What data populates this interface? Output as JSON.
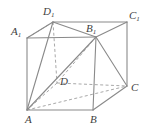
{
  "figure": {
    "kind": "3d-solid-diagram",
    "solid_name": "parallelepiped ABCD-A1B1C1D1",
    "stroke_color": "#8a8a8a",
    "hidden_stroke_color": "#a8a8a8",
    "label_color": "#3f3f3f",
    "background_color": "#ffffff",
    "vertices": [
      {
        "id": "D1",
        "base": "D",
        "sub": "1",
        "x": 53,
        "y": 22,
        "label_x": 43,
        "label_y": 6
      },
      {
        "id": "C1",
        "base": "C",
        "sub": "1",
        "x": 127,
        "y": 22,
        "label_x": 129,
        "label_y": 10
      },
      {
        "id": "A1",
        "base": "A",
        "sub": "1",
        "x": 27,
        "y": 38,
        "label_x": 11,
        "label_y": 26
      },
      {
        "id": "B1",
        "base": "B",
        "sub": "1",
        "x": 96,
        "y": 37,
        "label_x": 86,
        "label_y": 23
      },
      {
        "id": "D",
        "base": "D",
        "sub": "",
        "x": 57,
        "y": 83,
        "label_x": 60,
        "label_y": 76
      },
      {
        "id": "C",
        "base": "C",
        "sub": "",
        "x": 127,
        "y": 86,
        "label_x": 131,
        "label_y": 82
      },
      {
        "id": "A",
        "base": "A",
        "sub": "",
        "x": 27,
        "y": 110,
        "label_x": 25,
        "label_y": 114
      },
      {
        "id": "B",
        "base": "B",
        "sub": "",
        "x": 93,
        "y": 110,
        "label_x": 90,
        "label_y": 114
      }
    ],
    "edges_solid": [
      {
        "from": "A1",
        "to": "D1"
      },
      {
        "from": "D1",
        "to": "C1"
      },
      {
        "from": "A1",
        "to": "B1"
      },
      {
        "from": "B1",
        "to": "C1"
      },
      {
        "from": "A1",
        "to": "A"
      },
      {
        "from": "B1",
        "to": "B"
      },
      {
        "from": "C1",
        "to": "C"
      },
      {
        "from": "A",
        "to": "B"
      },
      {
        "from": "B",
        "to": "C"
      },
      {
        "from": "D1",
        "to": "A"
      },
      {
        "from": "D1",
        "to": "B1"
      },
      {
        "from": "B1",
        "to": "A"
      },
      {
        "from": "B1",
        "to": "C"
      }
    ],
    "edges_dashed": [
      {
        "from": "D1",
        "to": "D"
      },
      {
        "from": "D",
        "to": "A"
      },
      {
        "from": "D",
        "to": "C"
      },
      {
        "from": "D1",
        "to": "A1"
      },
      {
        "from": "A",
        "to": "C"
      },
      {
        "from": "B1",
        "to": "D"
      }
    ],
    "labels": {
      "D1": {
        "base": "D",
        "sub": "1"
      },
      "C1": {
        "base": "C",
        "sub": "1"
      },
      "A1": {
        "base": "A",
        "sub": "1"
      },
      "B1": {
        "base": "B",
        "sub": "1"
      },
      "D": {
        "base": "D",
        "sub": ""
      },
      "C": {
        "base": "C",
        "sub": ""
      },
      "A": {
        "base": "A",
        "sub": ""
      },
      "B": {
        "base": "B",
        "sub": ""
      }
    }
  }
}
